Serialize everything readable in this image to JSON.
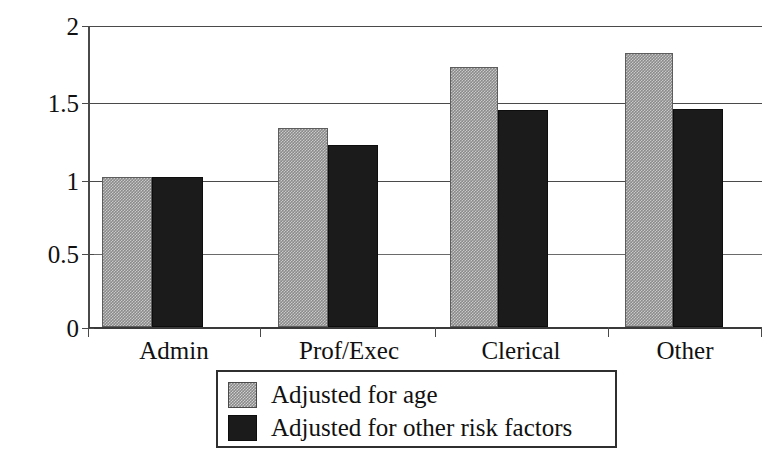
{
  "chart_data": {
    "type": "bar",
    "title": "",
    "subtitle": "",
    "xlabel": "",
    "ylabel": "",
    "categories": [
      "Admin",
      "Prof/Exec",
      "Clerical",
      "Other"
    ],
    "series": [
      {
        "name": "Adjusted for age",
        "color": "#8a8a8a",
        "fill": "gray-dither",
        "values": [
          1.0,
          1.32,
          1.73,
          1.82
        ]
      },
      {
        "name": "Adjusted for other risk factors",
        "color": "#1b1b1b",
        "fill": "solid-black",
        "values": [
          1.0,
          1.21,
          1.44,
          1.45
        ]
      }
    ],
    "ylim": [
      0,
      2
    ],
    "yticks": [
      0,
      0.5,
      1,
      1.5,
      2
    ],
    "ytick_labels": [
      "0",
      "0.5",
      "1",
      "1.5",
      "2"
    ],
    "grid": true,
    "grid_axis": "y",
    "legend_position": "below-center",
    "annotations": []
  },
  "axis": {
    "y_tick_labels": [
      "2",
      "1.5",
      "1",
      "0.5",
      "0"
    ],
    "x_tick_labels": [
      "Admin",
      "Prof/Exec",
      "Clerical",
      "Other"
    ]
  },
  "legend": {
    "entries": [
      {
        "label": "Adjusted for age",
        "swatch": "gray-swatch"
      },
      {
        "label": "Adjusted for other risk factors",
        "swatch": "black-swatch"
      }
    ]
  }
}
